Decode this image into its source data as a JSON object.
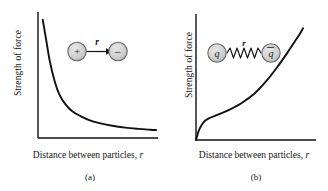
{
  "figure": {
    "background_color": "#ffffff",
    "line_color": "#111111",
    "particle_fill": "#cfcfcf",
    "particle_stroke": "#6b6b6b"
  },
  "panels": [
    {
      "id": "a",
      "caption": "(a)",
      "ylabel": "Strength of force",
      "xlabel_text": "Distance between particles,",
      "xlabel_var": "r",
      "inset": {
        "type": "two-particles-arrow",
        "left_particle_label": "+",
        "right_particle_label": "−",
        "separation_label": "r",
        "connector": "double-headed-arrow"
      }
    },
    {
      "id": "b",
      "caption": "(b)",
      "ylabel": "Strength of force",
      "xlabel_text": "Distance between particles,",
      "xlabel_var": "r",
      "inset": {
        "type": "two-particles-spring",
        "left_particle_label": "q",
        "right_particle_label": "q̄",
        "separation_label": "r",
        "connector": "spring"
      }
    }
  ],
  "chart_data": [
    {
      "type": "line",
      "id": "a",
      "title": "(a)",
      "xlabel": "Distance between particles, r",
      "ylabel": "Strength of force",
      "grid": false,
      "legend": false,
      "axis_ticks": false,
      "description": "Force falls off steeply with distance and approaches a low asymptote (inverse-square-like electromagnetic force).",
      "xlim": [
        0,
        1
      ],
      "ylim": [
        0,
        1
      ],
      "x": [
        0.04,
        0.07,
        0.1,
        0.14,
        0.18,
        0.23,
        0.29,
        0.36,
        0.44,
        0.53,
        0.63,
        0.74,
        0.85,
        0.95,
        1.0
      ],
      "y": [
        0.97,
        0.8,
        0.63,
        0.47,
        0.36,
        0.28,
        0.22,
        0.18,
        0.145,
        0.12,
        0.1,
        0.085,
        0.075,
        0.068,
        0.065
      ]
    },
    {
      "type": "line",
      "id": "b",
      "title": "(b)",
      "xlabel": "Distance between particles, r",
      "ylabel": "Strength of force",
      "grid": false,
      "legend": false,
      "axis_ticks": false,
      "description": "Force rises quickly from zero, plateaus over an intermediate range, then climbs steeply (strong/color force between quark and antiquark).",
      "xlim": [
        0,
        1
      ],
      "ylim": [
        0,
        1
      ],
      "x": [
        0.0,
        0.03,
        0.07,
        0.12,
        0.2,
        0.3,
        0.42,
        0.55,
        0.66,
        0.76,
        0.85,
        0.92,
        0.97,
        1.0
      ],
      "y": [
        0.0,
        0.09,
        0.155,
        0.19,
        0.22,
        0.26,
        0.32,
        0.41,
        0.52,
        0.64,
        0.76,
        0.86,
        0.93,
        0.98
      ]
    }
  ]
}
